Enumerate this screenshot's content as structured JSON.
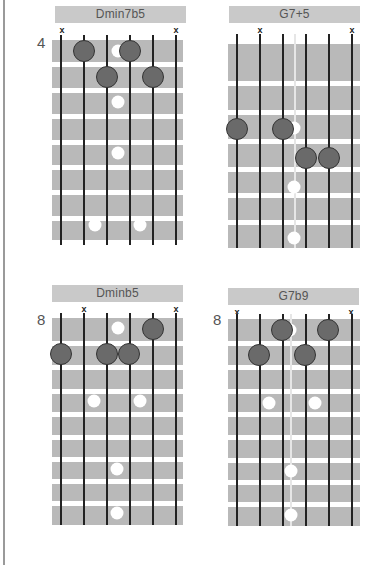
{
  "page": {
    "background": "#ffffff",
    "board_color": "#b9b9b9",
    "finger_color": "#6a6a6a",
    "title_bar_color": "#c9c9c9"
  },
  "diagrams": [
    {
      "name": "Dmin7b5",
      "title": "Dmin7b5",
      "start_fret": "4",
      "muted_strings": [
        "x",
        "x"
      ],
      "muted_string_indices": [
        1,
        6
      ],
      "fingers": [
        {
          "string": 2,
          "fret": 1
        },
        {
          "string": 4,
          "fret": 1
        },
        {
          "string": 3,
          "fret": 2
        },
        {
          "string": 5,
          "fret": 2
        }
      ],
      "position_markers": [
        "fret 1 center",
        "fret 3 center",
        "fret 5 center",
        "fret 8 double"
      ]
    },
    {
      "name": "G7+5",
      "title": "G7+5",
      "start_fret": "",
      "muted_strings": [
        "x",
        "x"
      ],
      "muted_string_indices": [
        2,
        6
      ],
      "fingers": [
        {
          "string": 1,
          "fret": 3
        },
        {
          "string": 3,
          "fret": 3
        },
        {
          "string": 4,
          "fret": 4
        },
        {
          "string": 5,
          "fret": 4
        }
      ],
      "position_markers": [
        "fret 3 center",
        "fret 5 center",
        "fret 7 center"
      ]
    },
    {
      "name": "Dminb5",
      "title": "Dminb5",
      "start_fret": "8",
      "muted_strings": [
        "x",
        "x"
      ],
      "muted_string_indices": [
        2,
        6
      ],
      "fingers": [
        {
          "string": 5,
          "fret": 1
        },
        {
          "string": 1,
          "fret": 2
        },
        {
          "string": 3,
          "fret": 2
        },
        {
          "string": 4,
          "fret": 2
        }
      ],
      "position_markers": [
        "fret 1 center",
        "fret 3 double",
        "fret 6 center",
        "fret 8 center"
      ]
    },
    {
      "name": "G7b9",
      "title": "G7b9",
      "start_fret": "8",
      "muted_strings": [
        "x",
        "x"
      ],
      "muted_string_indices": [
        1,
        6
      ],
      "fingers": [
        {
          "string": 3,
          "fret": 1
        },
        {
          "string": 5,
          "fret": 1
        },
        {
          "string": 2,
          "fret": 2
        },
        {
          "string": 4,
          "fret": 2
        }
      ],
      "position_markers": [
        "fret 1 center",
        "fret 3 double",
        "fret 6 center",
        "fret 8 center"
      ]
    }
  ]
}
